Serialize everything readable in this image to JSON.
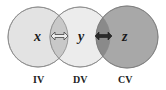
{
  "diagram": {
    "type": "venn",
    "circles": [
      {
        "id": "x",
        "variable": "x",
        "label": "IV",
        "cx": 38,
        "cy": 37,
        "r": 30,
        "fill": "#e3e3e3"
      },
      {
        "id": "y",
        "variable": "y",
        "label": "DV",
        "cx": 80,
        "cy": 37,
        "r": 30,
        "fill": "#ececec"
      },
      {
        "id": "z",
        "variable": "z",
        "label": "CV",
        "cx": 127,
        "cy": 37,
        "r": 31,
        "fill": "#a8a8a8"
      }
    ],
    "overlaps": [
      {
        "between": [
          "x",
          "y"
        ],
        "fill": "#c8c8c8",
        "arrow": "double-headed-outline"
      },
      {
        "between": [
          "y",
          "z"
        ],
        "fill": "#8a8a8a",
        "arrow": "double-headed-filled"
      }
    ],
    "stroke_color": "#8a8a8a"
  },
  "labels": {
    "x_var": "x",
    "y_var": "y",
    "z_var": "z",
    "iv": "IV",
    "dv": "DV",
    "cv": "CV"
  }
}
